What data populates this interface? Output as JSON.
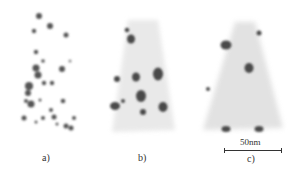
{
  "figure": {
    "panels": [
      {
        "id": "a",
        "label": "a)"
      },
      {
        "id": "b",
        "label": "b)"
      },
      {
        "id": "c",
        "label": "c)"
      }
    ],
    "scale_bar": {
      "text": "50nm"
    },
    "colors": {
      "cloud": "#c8c8c8",
      "precipitate": "#4a4a4a"
    }
  }
}
